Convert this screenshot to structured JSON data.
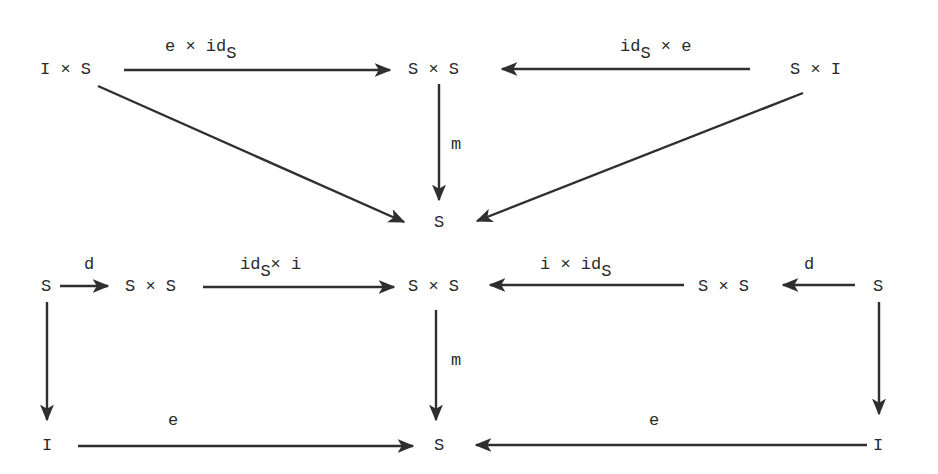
{
  "colors": {
    "ink": "#2a2a2a",
    "paper": "#ffffff"
  },
  "top_diagram": {
    "nodes": {
      "IxS": "I × S",
      "SxS": "S × S",
      "SxI": "S × I",
      "S": "S"
    },
    "arrows": {
      "e_x_id": {
        "main": "e × id",
        "sub": "S",
        "from": "I × S",
        "to": "S × S"
      },
      "id_x_e": {
        "main": "id",
        "sub": "S",
        "tail": " × e",
        "from": "S × I",
        "to": "S × S"
      },
      "m": {
        "label": "m",
        "from": "S × S",
        "to": "S"
      },
      "diag_left": {
        "from": "I × S",
        "to": "S"
      },
      "diag_right": {
        "from": "S × I",
        "to": "S"
      }
    }
  },
  "bottom_diagram": {
    "nodes": {
      "S_left": "S",
      "SxS_left": "S × S",
      "SxS_center": "S × S",
      "SxS_right": "S × S",
      "S_right": "S",
      "I_left": "I",
      "S_bottom": "S",
      "I_right": "I"
    },
    "arrows": {
      "d_left": {
        "label": "d",
        "from": "S",
        "to": "S × S"
      },
      "id_x_i": {
        "main": "id",
        "sub": "S",
        "tail": "× i",
        "from": "S × S",
        "to": "S × S"
      },
      "i_x_id": {
        "main": "i × id",
        "sub": "S",
        "from": "S × S",
        "to": "S × S"
      },
      "d_right": {
        "label": "d",
        "from": "S",
        "to": "S × S"
      },
      "m": {
        "label": "m",
        "from": "S × S",
        "to": "S"
      },
      "left_down": {
        "from": "S",
        "to": "I"
      },
      "right_down": {
        "from": "S",
        "to": "I"
      },
      "e_left": {
        "label": "e",
        "from": "I",
        "to": "S"
      },
      "e_right": {
        "label": "e",
        "from": "I",
        "to": "S"
      }
    }
  }
}
